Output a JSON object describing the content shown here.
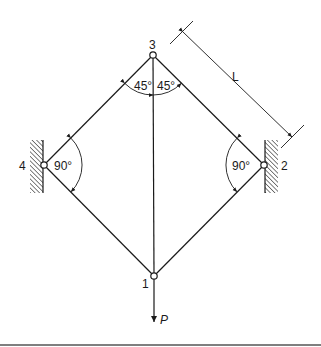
{
  "diagram": {
    "type": "truss",
    "nodes": [
      {
        "id": "1",
        "label": "1",
        "x": 154,
        "y": 276
      },
      {
        "id": "2",
        "label": "2",
        "x": 264,
        "y": 165
      },
      {
        "id": "3",
        "label": "3",
        "x": 153,
        "y": 55
      },
      {
        "id": "4",
        "label": "4",
        "x": 44,
        "y": 165
      }
    ],
    "members": [
      {
        "from": "3",
        "to": "4"
      },
      {
        "from": "3",
        "to": "2"
      },
      {
        "from": "4",
        "to": "1"
      },
      {
        "from": "2",
        "to": "1"
      },
      {
        "from": "3",
        "to": "1"
      }
    ],
    "supports": [
      {
        "node": "4",
        "type": "wall",
        "side": "left"
      },
      {
        "node": "2",
        "type": "wall",
        "side": "right"
      }
    ],
    "angles": {
      "top_left": "45°",
      "top_right": "45°",
      "left": "90°",
      "right": "90°"
    },
    "dimension": {
      "label": "L",
      "between": [
        "3",
        "2"
      ]
    },
    "load": {
      "label": "P",
      "node": "1",
      "direction": "down"
    }
  }
}
